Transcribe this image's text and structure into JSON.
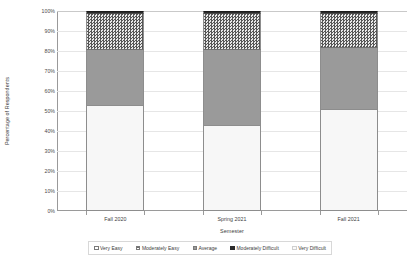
{
  "chart_data": {
    "type": "bar",
    "subtype": "stacked-100-percent",
    "title": "",
    "xlabel": "Semester",
    "ylabel": "Percentage of Respondents",
    "categories": [
      "Fall 2020",
      "Spring 2021",
      "Fall 2021"
    ],
    "ylim": [
      0,
      100
    ],
    "ytick_labels": [
      "0%",
      "10%",
      "20%",
      "30%",
      "40%",
      "50%",
      "60%",
      "70%",
      "80%",
      "90%",
      "100%"
    ],
    "ytick_values": [
      0,
      10,
      20,
      30,
      40,
      50,
      60,
      70,
      80,
      90,
      100
    ],
    "grid": true,
    "legend_position": "bottom",
    "series": [
      {
        "name": "Very Easy",
        "values": [
          53,
          43,
          51
        ]
      },
      {
        "name": "Moderately Easy",
        "values": [
          0,
          0,
          0
        ]
      },
      {
        "name": "Average",
        "values": [
          28,
          38,
          31
        ]
      },
      {
        "name": "Moderately Difficult",
        "values": [
          18,
          18,
          17
        ]
      },
      {
        "name": "Very Difficult",
        "values": [
          1,
          1,
          1
        ]
      }
    ]
  },
  "axes": {
    "y_title": "Percentage of Respondents",
    "x_title": "Semester",
    "y_ticks": [
      "100%",
      "90%",
      "80%",
      "70%",
      "60%",
      "50%",
      "40%",
      "30%",
      "20%",
      "10%",
      "0%"
    ],
    "x_ticks": [
      "Fall 2020",
      "Spring 2021",
      "Fall 2021"
    ]
  },
  "legend": {
    "items": [
      {
        "label": "Very Easy",
        "swatch": "very-easy"
      },
      {
        "label": "Moderately Easy",
        "swatch": "moderately-easy"
      },
      {
        "label": "Average",
        "swatch": "average"
      },
      {
        "label": "Moderately Difficult",
        "swatch": "moderately-difficult"
      },
      {
        "label": "Very Difficult",
        "swatch": "very-difficult"
      }
    ]
  },
  "colors": {
    "very_easy": "#f7f7f7",
    "moderately_easy": "#d2d2d2",
    "average": "#9a9a9a",
    "moderately_difficult": "#565656",
    "very_difficult": "#2b2b2b",
    "grid": "#e6e6e6",
    "axis": "#9a9a9a"
  }
}
